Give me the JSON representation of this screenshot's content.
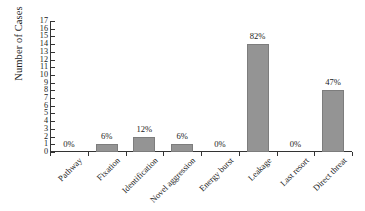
{
  "chart_data": {
    "type": "bar",
    "title": "",
    "xlabel": "",
    "ylabel": "Number of Cases",
    "ylim": [
      0,
      17
    ],
    "ytick_step": 1,
    "grid": false,
    "legend": null,
    "categories": [
      "Pathway",
      "Fixation",
      "Identification",
      "Novel aggression",
      "Energy burst",
      "Leakage",
      "Last resort",
      "Direct threat"
    ],
    "values": [
      0,
      1,
      2,
      1,
      0,
      14,
      0,
      8
    ],
    "data_labels": [
      "0%",
      "6%",
      "12%",
      "6%",
      "0%",
      "82%",
      "0%",
      "47%"
    ],
    "yticks": [
      "0",
      "1",
      "2",
      "3",
      "4",
      "5",
      "6",
      "7",
      "8",
      "9",
      "10",
      "11",
      "12",
      "13",
      "14",
      "15",
      "16",
      "17"
    ],
    "bar_color": "#949494",
    "axis_color": "#333333",
    "background_color": "#ffffff"
  }
}
